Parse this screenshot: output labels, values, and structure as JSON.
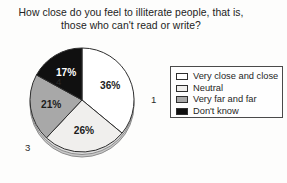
{
  "chart_data": {
    "type": "pie",
    "title": "How close do you feel to illiterate people, that is, those who can't read or write?",
    "title_lines": [
      "How close do you feel to illiterate people, that is,",
      "those who can't read or write?"
    ],
    "categories": [
      "Very close and close",
      "Neutral",
      "Very far and far",
      "Don't know"
    ],
    "values": [
      36,
      26,
      21,
      17
    ],
    "value_labels": [
      "36%",
      "26%",
      "21%",
      "17%"
    ],
    "slice_numbers": [
      "1",
      "2",
      "3",
      "4"
    ],
    "slice_colors": [
      "#ffffff",
      "#f0efed",
      "#a8a8a8",
      "#101010"
    ],
    "units": "percent",
    "legend_position": "right",
    "grid": false,
    "start_angle_deg": 0,
    "direction": "clockwise",
    "slices": [
      {
        "number": "1",
        "label": "Very close and close",
        "value": 36,
        "value_label": "36%",
        "color": "#ffffff",
        "text_color": "dark"
      },
      {
        "number": "2",
        "label": "Neutral",
        "value": 26,
        "value_label": "26%",
        "color": "#f0efed",
        "text_color": "dark"
      },
      {
        "number": "3",
        "label": "Very far and far",
        "value": 21,
        "value_label": "21%",
        "color": "#a8a8a8",
        "text_color": "dark"
      },
      {
        "number": "4",
        "label": "Don't know",
        "value": 17,
        "value_label": "17%",
        "color": "#101010",
        "text_color": "light"
      }
    ]
  },
  "legend": {
    "items": [
      {
        "label": "Very close and close",
        "color": "#ffffff"
      },
      {
        "label": "Neutral",
        "color": "#f0efed"
      },
      {
        "label": "Very far and far",
        "color": "#a8a8a8"
      },
      {
        "label": "Don't know",
        "color": "#101010"
      }
    ]
  },
  "colors": {
    "background": "#fdfdfc",
    "outline": "#2e2e2e",
    "text": "#1f1f1f",
    "legend_border": "#4a4a4a",
    "pie_base_shadow": "#9b9b9b"
  }
}
